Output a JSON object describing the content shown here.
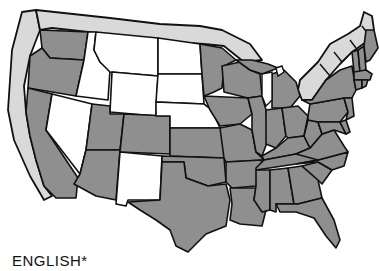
{
  "caption": "ENGLISH*",
  "legend": {
    "official_color": "#8f8f8f",
    "not_official_color": "#ffffff",
    "extrusion_color": "#d9d9d9"
  },
  "map": {
    "subject": "United States — states with English as official language",
    "states_shaded": [
      "WA",
      "OR",
      "CA",
      "AZ",
      "UT",
      "CO",
      "KS",
      "OK",
      "TX",
      "MO",
      "IA",
      "MN",
      "WI",
      "IL",
      "IN",
      "MI",
      "OH",
      "KY",
      "TN",
      "AR",
      "LA",
      "MS",
      "AL",
      "GA",
      "FL",
      "SC",
      "NC",
      "VA",
      "WV",
      "PA",
      "NY",
      "VT",
      "NH",
      "ME",
      "MA",
      "CT",
      "RI",
      "NJ",
      "DE",
      "MD"
    ],
    "states_unshaded": [
      "ID",
      "MT",
      "WY",
      "ND",
      "SD",
      "NE",
      "NV",
      "NM"
    ]
  }
}
